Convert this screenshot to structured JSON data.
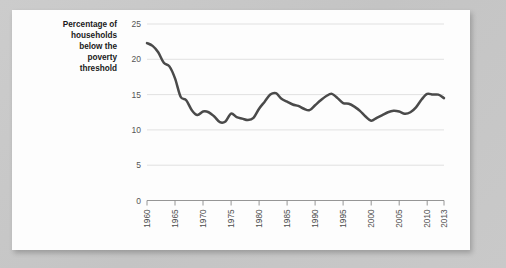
{
  "card": {
    "background": "#fdfdfd",
    "page_background": "#c8c8c8"
  },
  "chart_data": {
    "type": "line",
    "title": "",
    "subtitle": "",
    "xlabel": "",
    "ylabel": "Percentage of households below the poverty threshold",
    "ylabel_lines": [
      "Percentage of",
      "households",
      "below the",
      "poverty",
      "threshold"
    ],
    "xlim": [
      1960,
      2013
    ],
    "ylim": [
      0,
      25
    ],
    "yticks": [
      0,
      5,
      10,
      15,
      20,
      25
    ],
    "ytick_labels": [
      "0",
      "5",
      "10",
      "15",
      "20",
      "25"
    ],
    "xticks": [
      1960,
      1965,
      1970,
      1975,
      1980,
      1985,
      1990,
      1995,
      2000,
      2005,
      2010,
      2013
    ],
    "xtick_labels": [
      "1960",
      "1965",
      "1970",
      "1975",
      "1980",
      "1985",
      "1990",
      "1995",
      "2000",
      "2005",
      "2010",
      "2013"
    ],
    "xtick_orientation": "vertical",
    "grid": "horizontal",
    "grid_color": "#dedede",
    "legend": "none",
    "line_color": "#4a4a4a",
    "line_width": 2.5,
    "series": [
      {
        "name": "Percentage of households below the poverty threshold",
        "x": [
          1960,
          1961,
          1962,
          1963,
          1964,
          1965,
          1966,
          1967,
          1968,
          1969,
          1970,
          1971,
          1972,
          1973,
          1974,
          1975,
          1976,
          1977,
          1978,
          1979,
          1980,
          1981,
          1982,
          1983,
          1984,
          1985,
          1986,
          1987,
          1988,
          1989,
          1990,
          1991,
          1992,
          1993,
          1994,
          1995,
          1996,
          1997,
          1998,
          1999,
          2000,
          2001,
          2002,
          2003,
          2004,
          2005,
          2006,
          2007,
          2008,
          2009,
          2010,
          2011,
          2012,
          2013
        ],
        "values": [
          22.3,
          21.9,
          21.0,
          19.5,
          19.0,
          17.3,
          14.7,
          14.2,
          12.8,
          12.1,
          12.6,
          12.5,
          11.9,
          11.1,
          11.2,
          12.3,
          11.8,
          11.6,
          11.4,
          11.7,
          13.0,
          14.0,
          15.0,
          15.2,
          14.4,
          14.0,
          13.6,
          13.4,
          13.0,
          12.8,
          13.5,
          14.2,
          14.8,
          15.1,
          14.5,
          13.8,
          13.7,
          13.3,
          12.7,
          11.9,
          11.3,
          11.7,
          12.1,
          12.5,
          12.7,
          12.6,
          12.3,
          12.5,
          13.2,
          14.3,
          15.1,
          15.0,
          15.0,
          14.5
        ]
      }
    ]
  }
}
